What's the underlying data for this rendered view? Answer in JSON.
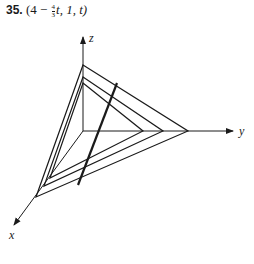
{
  "problem": {
    "number": "35.",
    "expr_prefix": "(4 − ",
    "frac_num": "4",
    "frac_den": "3",
    "expr_suffix": "t, 1, t)"
  },
  "axes": {
    "x_label": "x",
    "y_label": "y",
    "z_label": "z"
  },
  "colors": {
    "ink": "#1a1a1a",
    "background": "#ffffff"
  }
}
